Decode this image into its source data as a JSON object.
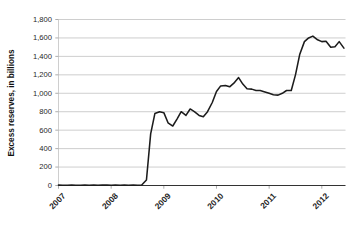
{
  "chart_data": {
    "type": "line",
    "title": "",
    "subtitle": "",
    "xlabel": "",
    "ylabel": "Excess reserves, in billions",
    "xlim": [
      2007.0,
      2012.45
    ],
    "ylim": [
      0,
      1800
    ],
    "grid": true,
    "grid_axis": "y",
    "legend": "none",
    "line_color": "#1c1c1c",
    "grid_color": "#b9b9b9",
    "axis_color": "#333333",
    "background_color": "#ffffff",
    "y_ticks": [
      0,
      200,
      400,
      600,
      800,
      1000,
      1200,
      1400,
      1600,
      1800
    ],
    "y_tick_labels": [
      "0",
      "200",
      "400",
      "600",
      "800",
      "1,000",
      "1,200",
      "1,400",
      "1,600",
      "1,800"
    ],
    "x_ticks": [
      2007,
      2008,
      2009,
      2010,
      2011,
      2012
    ],
    "x_tick_labels": [
      "2007",
      "2008",
      "2009",
      "2010",
      "2011",
      "2012"
    ],
    "series": [
      {
        "name": "Excess reserves",
        "units": "billions of dollars",
        "x": [
          2007.0,
          2007.08,
          2007.17,
          2007.25,
          2007.33,
          2007.42,
          2007.5,
          2007.58,
          2007.67,
          2007.75,
          2007.83,
          2007.92,
          2008.0,
          2008.08,
          2008.17,
          2008.25,
          2008.33,
          2008.42,
          2008.5,
          2008.58,
          2008.67,
          2008.75,
          2008.83,
          2008.92,
          2009.0,
          2009.08,
          2009.17,
          2009.25,
          2009.33,
          2009.42,
          2009.5,
          2009.58,
          2009.67,
          2009.75,
          2009.83,
          2009.92,
          2010.0,
          2010.08,
          2010.17,
          2010.25,
          2010.33,
          2010.42,
          2010.5,
          2010.58,
          2010.67,
          2010.75,
          2010.83,
          2010.92,
          2011.0,
          2011.08,
          2011.17,
          2011.25,
          2011.33,
          2011.42,
          2011.5,
          2011.58,
          2011.67,
          2011.75,
          2011.83,
          2011.92,
          2012.0,
          2012.08,
          2012.17,
          2012.25,
          2012.33,
          2012.42
        ],
        "y": [
          4,
          3,
          3,
          4,
          3,
          3,
          4,
          3,
          4,
          3,
          4,
          5,
          3,
          4,
          3,
          4,
          3,
          4,
          3,
          5,
          60,
          560,
          780,
          800,
          790,
          680,
          645,
          720,
          800,
          760,
          830,
          800,
          760,
          745,
          800,
          900,
          1020,
          1080,
          1085,
          1070,
          1110,
          1170,
          1100,
          1050,
          1045,
          1030,
          1030,
          1015,
          1000,
          985,
          980,
          1000,
          1030,
          1030,
          1200,
          1420,
          1560,
          1600,
          1620,
          1580,
          1560,
          1565,
          1500,
          1505,
          1560,
          1490
        ]
      }
    ],
    "annotations": []
  }
}
